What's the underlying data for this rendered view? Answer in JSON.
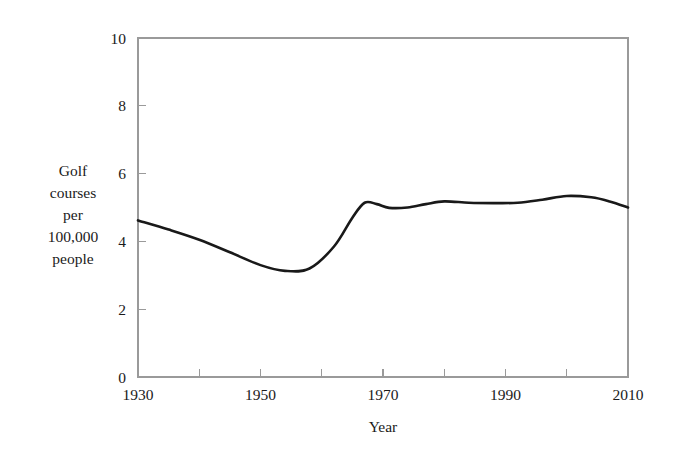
{
  "chart_data": {
    "type": "line",
    "title": "",
    "xlabel": "Year",
    "ylabel": "Golf courses per 100,000 people",
    "ylabel_lines": [
      "Golf",
      "courses",
      "per",
      "100,000",
      "people"
    ],
    "xlim": [
      1930,
      2010
    ],
    "ylim": [
      0,
      10
    ],
    "grid": false,
    "legend": "none",
    "x_tick_labels": [
      "1930",
      "1950",
      "1970",
      "1990",
      "2010"
    ],
    "x_tick_values": [
      1930,
      1950,
      1970,
      1990,
      2010
    ],
    "x_minor_tick_values": [
      1940,
      1950,
      1960,
      1970,
      1980,
      1990,
      2000
    ],
    "y_tick_labels": [
      "0",
      "2",
      "4",
      "6",
      "8",
      "10"
    ],
    "y_tick_values": [
      0,
      2,
      4,
      6,
      8,
      10
    ],
    "series": [
      {
        "name": "Golf courses per 100,000 people",
        "color": "#191919",
        "x": [
          1930,
          1935,
          1940,
          1945,
          1950,
          1954,
          1958,
          1962,
          1965,
          1967,
          1969,
          1971,
          1974,
          1977,
          1980,
          1984,
          1988,
          1992,
          1996,
          2000,
          2004,
          2007,
          2010
        ],
        "values": [
          4.62,
          4.35,
          4.05,
          3.68,
          3.3,
          3.13,
          3.2,
          3.85,
          4.7,
          5.14,
          5.1,
          4.99,
          5.0,
          5.1,
          5.18,
          5.14,
          5.13,
          5.14,
          5.23,
          5.34,
          5.3,
          5.18,
          5.0
        ]
      }
    ],
    "annotations": []
  },
  "layout": {
    "plot_left": 138,
    "plot_right": 628,
    "plot_top": 38,
    "plot_bottom": 377,
    "frame_color": "#9a9a9a",
    "background": "#ffffff"
  }
}
